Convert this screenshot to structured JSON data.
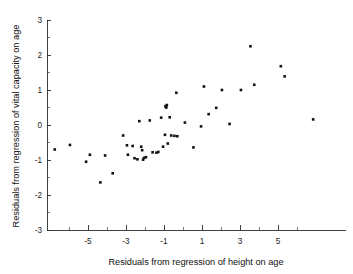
{
  "chart_data": {
    "type": "scatter",
    "title": "",
    "xlabel": "Residuals from regression of height on age",
    "ylabel": "Residuals from regression of vital capacity on age",
    "xlim": [
      -6.8,
      7.0
    ],
    "ylim": [
      -3,
      3
    ],
    "grid": false,
    "legend": null,
    "x_ticks": [
      -5,
      -3,
      -1,
      1,
      3,
      5
    ],
    "x_tick_labels": [
      "-5",
      "-3",
      "-1",
      "1",
      "3",
      "5"
    ],
    "x_minor_ticks": [
      -6,
      -4,
      -2,
      0,
      2,
      4,
      6
    ],
    "y_ticks": [
      3,
      2,
      1,
      0,
      -1,
      -2,
      -3
    ],
    "y_tick_labels": [
      "3",
      "2",
      "1",
      "0",
      "-1",
      "-2",
      "-3"
    ],
    "marker": "square",
    "marker_color": "#111111",
    "marker_size": 2.6,
    "n_points": 50,
    "points": [
      [
        -6.75,
        -0.7
      ],
      [
        -5.95,
        -0.57
      ],
      [
        -5.1,
        -1.05
      ],
      [
        -4.9,
        -0.85
      ],
      [
        -4.35,
        -1.64
      ],
      [
        -4.1,
        -0.87
      ],
      [
        -3.7,
        -1.38
      ],
      [
        -3.15,
        -0.3
      ],
      [
        -2.95,
        -0.58
      ],
      [
        -2.9,
        -0.85
      ],
      [
        -2.55,
        -0.95
      ],
      [
        -2.4,
        -0.98
      ],
      [
        -2.3,
        0.11
      ],
      [
        -2.2,
        -0.62
      ],
      [
        -2.15,
        -0.72
      ],
      [
        -2.1,
        -0.99
      ],
      [
        -1.75,
        0.13
      ],
      [
        -1.6,
        -0.78
      ],
      [
        -1.4,
        -0.79
      ],
      [
        -1.15,
        0.21
      ],
      [
        -1.05,
        -0.62
      ],
      [
        -0.95,
        -0.28
      ],
      [
        -0.9,
        0.52
      ],
      [
        -0.85,
        0.57
      ],
      [
        -0.8,
        -0.53
      ],
      [
        -0.7,
        0.22
      ],
      [
        -0.62,
        -0.3
      ],
      [
        -0.35,
        0.92
      ],
      [
        -0.3,
        -0.32
      ],
      [
        0.1,
        0.07
      ],
      [
        0.55,
        -0.64
      ],
      [
        0.95,
        -0.04
      ],
      [
        1.1,
        1.1
      ],
      [
        1.35,
        0.31
      ],
      [
        1.75,
        0.49
      ],
      [
        2.05,
        1.0
      ],
      [
        2.45,
        0.03
      ],
      [
        3.05,
        1.0
      ],
      [
        3.55,
        2.25
      ],
      [
        3.75,
        1.15
      ],
      [
        5.15,
        1.68
      ],
      [
        5.35,
        1.39
      ],
      [
        6.85,
        0.16
      ],
      [
        -2.65,
        -0.6
      ],
      [
        -1.95,
        -0.92
      ],
      [
        -0.88,
        0.5
      ],
      [
        -0.92,
        0.54
      ],
      [
        -2.05,
        -0.94
      ],
      [
        -1.3,
        -0.77
      ],
      [
        -0.45,
        -0.31
      ]
    ]
  }
}
